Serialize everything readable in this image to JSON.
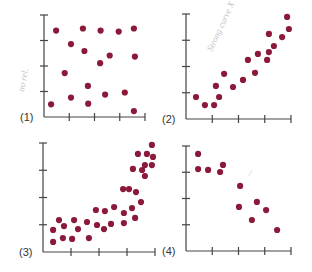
{
  "figure": {
    "dot_color": "#8b1a3a",
    "axis_color": "#444444",
    "background": "#ffffff"
  },
  "annotations": [
    {
      "panel": "1",
      "text": "no rel.",
      "note": "faint handwritten pencil mark left of panel 1 y-axis"
    },
    {
      "panel": "2",
      "text": "Strong curve X",
      "note": "faint handwritten pencil mark inside panel 2"
    },
    {
      "panel": "4",
      "text": "/",
      "note": "faint pencil stroke in panel 4"
    }
  ],
  "chart_data": [
    {
      "type": "scatter",
      "label": "(1)",
      "title": "",
      "xlabel": "",
      "ylabel": "",
      "xlim": [
        0,
        4
      ],
      "ylim": [
        0,
        4
      ],
      "grid": false,
      "x_ticks": 4,
      "y_ticks": 3,
      "frame": {
        "x0": 44,
        "y0": 117,
        "x1": 145,
        "y1": 15
      },
      "points": [
        {
          "x": 0.28,
          "y": 0.5
        },
        {
          "x": 1.07,
          "y": 0.76
        },
        {
          "x": 0.82,
          "y": 1.72
        },
        {
          "x": 1.75,
          "y": 0.52
        },
        {
          "x": 2.42,
          "y": 0.88
        },
        {
          "x": 1.74,
          "y": 1.22
        },
        {
          "x": 3.2,
          "y": 0.96
        },
        {
          "x": 3.56,
          "y": 0.23
        },
        {
          "x": 2.22,
          "y": 2.11
        },
        {
          "x": 2.6,
          "y": 2.41
        },
        {
          "x": 3.6,
          "y": 2.37
        },
        {
          "x": 1.6,
          "y": 2.59
        },
        {
          "x": 1.07,
          "y": 2.86
        },
        {
          "x": 0.48,
          "y": 3.39
        },
        {
          "x": 1.54,
          "y": 3.47
        },
        {
          "x": 2.24,
          "y": 3.39
        },
        {
          "x": 2.96,
          "y": 3.35
        },
        {
          "x": 3.56,
          "y": 3.47
        }
      ]
    },
    {
      "type": "scatter",
      "label": "(2)",
      "title": "",
      "xlabel": "",
      "ylabel": "",
      "xlim": [
        0,
        4
      ],
      "ylim": [
        0,
        4
      ],
      "grid": false,
      "x_ticks": 4,
      "y_ticks": 3,
      "frame": {
        "x0": 186,
        "y0": 119,
        "x1": 291,
        "y1": 14
      },
      "points": [
        {
          "x": 0.38,
          "y": 0.84
        },
        {
          "x": 0.72,
          "y": 0.53
        },
        {
          "x": 1.07,
          "y": 0.53
        },
        {
          "x": 1.26,
          "y": 0.84
        },
        {
          "x": 1.14,
          "y": 1.26
        },
        {
          "x": 1.45,
          "y": 1.72
        },
        {
          "x": 1.79,
          "y": 1.22
        },
        {
          "x": 2.17,
          "y": 1.49
        },
        {
          "x": 2.63,
          "y": 1.76
        },
        {
          "x": 2.36,
          "y": 2.25
        },
        {
          "x": 2.74,
          "y": 2.48
        },
        {
          "x": 3.09,
          "y": 2.25
        },
        {
          "x": 3.16,
          "y": 2.55
        },
        {
          "x": 3.35,
          "y": 2.78
        },
        {
          "x": 3.16,
          "y": 3.24
        },
        {
          "x": 3.66,
          "y": 3.12
        },
        {
          "x": 3.92,
          "y": 3.43
        },
        {
          "x": 3.85,
          "y": 3.89
        }
      ]
    },
    {
      "type": "scatter",
      "label": "(3)",
      "title": "",
      "xlabel": "",
      "ylabel": "",
      "xlim": [
        0,
        4
      ],
      "ylim": [
        0,
        4
      ],
      "grid": false,
      "x_ticks": 4,
      "y_ticks": 3,
      "frame": {
        "x0": 43,
        "y0": 252,
        "x1": 155,
        "y1": 143
      },
      "points": [
        {
          "x": 0.36,
          "y": 0.81
        },
        {
          "x": 0.36,
          "y": 0.37
        },
        {
          "x": 0.57,
          "y": 1.17
        },
        {
          "x": 0.75,
          "y": 0.95
        },
        {
          "x": 0.71,
          "y": 0.51
        },
        {
          "x": 1.04,
          "y": 0.48
        },
        {
          "x": 1.11,
          "y": 1.17
        },
        {
          "x": 1.25,
          "y": 0.84
        },
        {
          "x": 1.57,
          "y": 1.1
        },
        {
          "x": 1.64,
          "y": 0.51
        },
        {
          "x": 1.89,
          "y": 1.54
        },
        {
          "x": 1.93,
          "y": 0.99
        },
        {
          "x": 2.18,
          "y": 0.84
        },
        {
          "x": 2.21,
          "y": 1.5
        },
        {
          "x": 2.43,
          "y": 1.03
        },
        {
          "x": 2.54,
          "y": 1.65
        },
        {
          "x": 2.86,
          "y": 2.31
        },
        {
          "x": 2.89,
          "y": 1.43
        },
        {
          "x": 2.89,
          "y": 1.06
        },
        {
          "x": 3.07,
          "y": 2.31
        },
        {
          "x": 3.18,
          "y": 1.61
        },
        {
          "x": 3.29,
          "y": 1.25
        },
        {
          "x": 3.32,
          "y": 2.2
        },
        {
          "x": 3.5,
          "y": 1.83
        },
        {
          "x": 3.21,
          "y": 3.05
        },
        {
          "x": 3.39,
          "y": 3.6
        },
        {
          "x": 3.54,
          "y": 3.01
        },
        {
          "x": 3.64,
          "y": 3.19
        },
        {
          "x": 3.64,
          "y": 2.79
        },
        {
          "x": 3.71,
          "y": 3.6
        },
        {
          "x": 3.89,
          "y": 3.93
        },
        {
          "x": 3.93,
          "y": 3.49
        },
        {
          "x": 3.89,
          "y": 3.19
        }
      ]
    },
    {
      "type": "scatter",
      "label": "(4)",
      "title": "",
      "xlabel": "",
      "ylabel": "",
      "xlim": [
        0,
        4
      ],
      "ylim": [
        0,
        4
      ],
      "grid": false,
      "x_ticks": 4,
      "y_ticks": 3,
      "frame": {
        "x0": 186,
        "y0": 251,
        "x1": 291,
        "y1": 146
      },
      "points": [
        {
          "x": 0.46,
          "y": 3.7
        },
        {
          "x": 0.46,
          "y": 3.12
        },
        {
          "x": 0.84,
          "y": 3.09
        },
        {
          "x": 1.3,
          "y": 3.01
        },
        {
          "x": 1.41,
          "y": 3.28
        },
        {
          "x": 2.06,
          "y": 2.48
        },
        {
          "x": 2.02,
          "y": 1.68
        },
        {
          "x": 2.7,
          "y": 1.87
        },
        {
          "x": 3.05,
          "y": 1.56
        },
        {
          "x": 2.51,
          "y": 1.18
        },
        {
          "x": 3.47,
          "y": 0.8
        }
      ]
    }
  ]
}
